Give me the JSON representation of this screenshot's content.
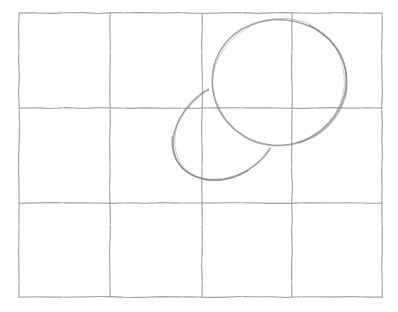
{
  "canvas": {
    "width": 398,
    "height": 312,
    "background_color": "#fefefe"
  },
  "grid": {
    "columns": 4,
    "rows": 3,
    "x_lines": [
      19,
      110,
      202,
      292,
      382
    ],
    "y_lines": [
      13,
      108,
      203,
      297
    ],
    "stroke_color": "#a5a29e",
    "stroke_width": 1.1,
    "style": "hand-drawn pencil"
  },
  "shapes": [
    {
      "name": "large-oval",
      "type": "ellipse",
      "cx": 279,
      "cy": 82,
      "rx": 66,
      "ry": 64,
      "rotation_deg": -8,
      "arc_from_deg": 0,
      "arc_to_deg": 360,
      "closed": true,
      "stroke_color": "#8f8c88",
      "stroke_width": 1.7,
      "shade_from_deg": -55,
      "shade_to_deg": 80,
      "shade_color": "#7d7a76"
    },
    {
      "name": "small-oval",
      "type": "ellipse",
      "cx": 226,
      "cy": 131,
      "rx": 56,
      "ry": 45,
      "rotation_deg": -35,
      "arc_from_deg": 62,
      "arc_to_deg": 280,
      "closed": false,
      "stroke_color": "#8f8c88",
      "stroke_width": 1.7,
      "shade_from_deg": 95,
      "shade_to_deg": 215,
      "shade_color": "#7d7a76",
      "occlusion": "drawn only outside the large oval"
    }
  ]
}
